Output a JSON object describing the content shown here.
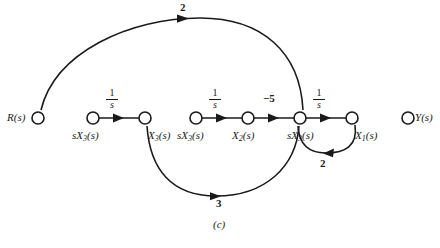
{
  "figure": {
    "caption": "(c)",
    "type": "signal-flow-graph",
    "stroke_color": "#1a1a1a",
    "background_color": "#ffffff",
    "node_fill": "#ffffff"
  },
  "nodes": [
    {
      "id": "R",
      "label_main": "R",
      "label_sub": "",
      "label_paren": "(s)",
      "x": 38,
      "y": 118,
      "label_x": 7,
      "label_y": 112,
      "label_align": "right"
    },
    {
      "id": "sX3a",
      "label_main": "sX",
      "label_sub": "3",
      "label_paren": "(s)",
      "x": 93,
      "y": 118,
      "label_x": 72,
      "label_y": 130,
      "label_align": "left"
    },
    {
      "id": "X3",
      "label_main": "X",
      "label_sub": "3",
      "label_paren": "(s)",
      "x": 145,
      "y": 118,
      "label_x": 148,
      "label_y": 130,
      "label_align": "left"
    },
    {
      "id": "sX3b",
      "label_main": "sX",
      "label_sub": "3",
      "label_paren": "(s)",
      "x": 196,
      "y": 118,
      "label_x": 177,
      "label_y": 130,
      "label_align": "left"
    },
    {
      "id": "X2",
      "label_main": "X",
      "label_sub": "2",
      "label_paren": "(s)",
      "x": 248,
      "y": 118,
      "label_x": 232,
      "label_y": 130,
      "label_align": "left"
    },
    {
      "id": "sX3c",
      "label_main": "sX",
      "label_sub": "3",
      "label_paren": "(s)",
      "x": 300,
      "y": 118,
      "label_x": 287,
      "label_y": 130,
      "label_align": "left"
    },
    {
      "id": "X1",
      "label_main": "X",
      "label_sub": "1",
      "label_paren": "(s)",
      "x": 352,
      "y": 118,
      "label_x": 355,
      "label_y": 130,
      "label_align": "left"
    },
    {
      "id": "Y",
      "label_main": "Y",
      "label_sub": "",
      "label_paren": "(s)",
      "x": 408,
      "y": 118,
      "label_x": 415,
      "label_y": 112,
      "label_align": "left"
    }
  ],
  "edges": [
    {
      "id": "e-r-to-junction",
      "from": "R",
      "to": "sX3c",
      "gain": "2",
      "gain_kind": "number",
      "gain_x": 180,
      "gain_y": 2,
      "shape": "arc-top"
    },
    {
      "id": "e-sx3a-to-x3",
      "from": "sX3a",
      "to": "X3",
      "gain_kind": "fraction",
      "gain_num": "1",
      "gain_den": "s",
      "gain_x": 112,
      "gain_y": 88,
      "shape": "straight"
    },
    {
      "id": "e-x3-to-junction",
      "from": "X3",
      "to": "sX3c",
      "gain": "3",
      "gain_kind": "number",
      "gain_x": 216,
      "gain_y": 196,
      "shape": "arc-bottom"
    },
    {
      "id": "e-sx3b-to-x2",
      "from": "sX3b",
      "to": "X2",
      "gain_kind": "fraction",
      "gain_num": "1",
      "gain_den": "s",
      "gain_x": 215,
      "gain_y": 88,
      "shape": "straight"
    },
    {
      "id": "e-x2-to-junction",
      "from": "X2",
      "to": "sX3c",
      "gain": "−5",
      "gain_kind": "number",
      "gain_x": 265,
      "gain_y": 92,
      "shape": "straight"
    },
    {
      "id": "e-junction-to-x1",
      "from": "sX3c",
      "to": "X1",
      "gain_kind": "fraction",
      "gain_num": "1",
      "gain_den": "s",
      "gain_x": 319,
      "gain_y": 88,
      "shape": "straight"
    },
    {
      "id": "e-x1-to-junction-loop",
      "from": "X1",
      "to": "sX3c",
      "gain": "2",
      "gain_kind": "number",
      "gain_x": 322,
      "gain_y": 160,
      "shape": "loop-bottom"
    }
  ]
}
